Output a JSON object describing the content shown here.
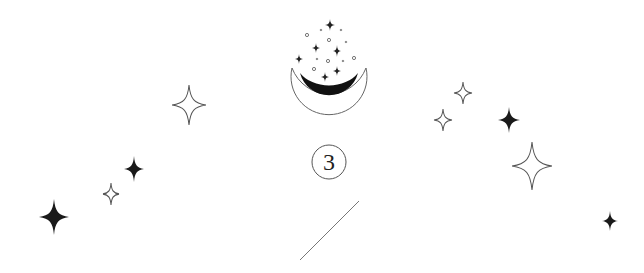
{
  "illustration": {
    "number": "3",
    "colors": {
      "ink": "#1a1a1a",
      "outline": "#555555",
      "background": "#ffffff"
    },
    "stars": [
      {
        "x": 189,
        "y": 105,
        "w": 34,
        "h": 40,
        "style": "outline"
      },
      {
        "x": 134,
        "y": 169,
        "w": 20,
        "h": 26,
        "style": "filled"
      },
      {
        "x": 111,
        "y": 194,
        "w": 16,
        "h": 22,
        "style": "outline"
      },
      {
        "x": 54,
        "y": 217,
        "w": 30,
        "h": 36,
        "style": "filled"
      },
      {
        "x": 463,
        "y": 93,
        "w": 18,
        "h": 22,
        "style": "outline"
      },
      {
        "x": 443,
        "y": 120,
        "w": 18,
        "h": 22,
        "style": "outline"
      },
      {
        "x": 509,
        "y": 120,
        "w": 22,
        "h": 26,
        "style": "filled"
      },
      {
        "x": 532,
        "y": 166,
        "w": 40,
        "h": 48,
        "style": "outline"
      },
      {
        "x": 610,
        "y": 221,
        "w": 16,
        "h": 20,
        "style": "filled"
      }
    ]
  }
}
